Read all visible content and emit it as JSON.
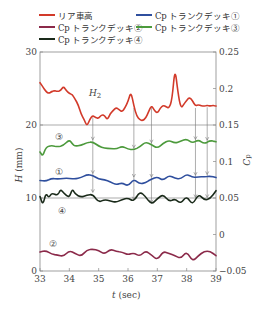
{
  "legend": {
    "items": [
      {
        "label": "リア車高",
        "color": "#d23a2a",
        "x": 39,
        "y": 14
      },
      {
        "label": "Cp トランクデッキ①",
        "color": "#2f4f9e",
        "x": 136,
        "y": 14
      },
      {
        "label": "Cp トランクデッキ②",
        "color": "#8b2a4a",
        "x": 39,
        "y": 25
      },
      {
        "label": "Cp トランクデッキ③",
        "color": "#4c9a3c",
        "x": 136,
        "y": 25
      },
      {
        "label": "Cp トランクデッキ④",
        "color": "#1a2a1a",
        "x": 39,
        "y": 36
      }
    ]
  },
  "chart_data": {
    "type": "line",
    "title": "",
    "xlabel": "t (sec)",
    "ylabel": "H (mm)",
    "y2label": "Cp",
    "xlim": [
      33,
      39
    ],
    "ylim": [
      0,
      30
    ],
    "y2lim": [
      -0.05,
      0.25
    ],
    "xticks": [
      "33",
      "34",
      "35",
      "36",
      "37",
      "38",
      "39"
    ],
    "yticks": [
      "0",
      "10",
      "20",
      "30"
    ],
    "y2ticks": [
      "-0.05",
      "0",
      "0.05",
      "0.1",
      "0.15",
      "0.2",
      "0.25"
    ],
    "grid": "horizontal lines at H=10 and H=20",
    "annotations": [
      "H2",
      "①",
      "②",
      "③",
      "④"
    ],
    "arrow_times": [
      34.8,
      36.2,
      36.8,
      38.3,
      38.7
    ],
    "series": [
      {
        "name": "リア車高",
        "axis": "left",
        "color": "#d23a2a",
        "x": [
          33.0,
          33.1,
          33.2,
          33.3,
          33.4,
          33.5,
          33.6,
          33.7,
          33.8,
          33.9,
          34.0,
          34.1,
          34.2,
          34.3,
          34.4,
          34.5,
          34.6,
          34.7,
          34.8,
          34.9,
          35.0,
          35.1,
          35.2,
          35.3,
          35.4,
          35.5,
          35.6,
          35.7,
          35.8,
          35.9,
          36.0,
          36.1,
          36.2,
          36.3,
          36.4,
          36.5,
          36.6,
          36.7,
          36.8,
          36.9,
          37.0,
          37.1,
          37.2,
          37.3,
          37.4,
          37.5,
          37.6,
          37.7,
          37.8,
          37.9,
          38.0,
          38.1,
          38.2,
          38.3,
          38.4,
          38.5,
          38.6,
          38.7,
          38.8,
          38.9,
          39.0
        ],
        "values": [
          25.8,
          25.2,
          24.6,
          24.3,
          24.6,
          24.7,
          24.6,
          24.7,
          25.3,
          24.7,
          24.3,
          24.2,
          23.5,
          22.8,
          21.5,
          20.8,
          19.8,
          20.8,
          21.3,
          21.0,
          20.9,
          21.4,
          21.3,
          20.7,
          21.6,
          22.0,
          22.4,
          22.1,
          21.8,
          22.4,
          23.2,
          24.6,
          22.6,
          21.2,
          20.7,
          20.6,
          20.9,
          21.8,
          22.7,
          22.0,
          21.6,
          22.3,
          22.7,
          22.5,
          22.3,
          23.4,
          27.9,
          24.5,
          22.3,
          22.8,
          23.4,
          23.8,
          23.3,
          22.6,
          22.8,
          22.6,
          22.6,
          22.7,
          22.6,
          22.7,
          22.6
        ]
      },
      {
        "name": "Cp トランクデッキ①",
        "axis": "right",
        "color": "#2f4f9e",
        "x": [
          33.0,
          33.2,
          33.4,
          33.6,
          33.8,
          34.0,
          34.2,
          34.4,
          34.6,
          34.8,
          35.0,
          35.2,
          35.4,
          35.6,
          35.8,
          36.0,
          36.2,
          36.4,
          36.6,
          36.8,
          37.0,
          37.2,
          37.4,
          37.6,
          37.8,
          38.0,
          38.2,
          38.4,
          38.6,
          38.8,
          39.0
        ],
        "values": [
          0.074,
          0.073,
          0.077,
          0.076,
          0.077,
          0.077,
          0.076,
          0.078,
          0.082,
          0.081,
          0.076,
          0.075,
          0.072,
          0.068,
          0.071,
          0.066,
          0.076,
          0.069,
          0.071,
          0.076,
          0.079,
          0.074,
          0.081,
          0.077,
          0.076,
          0.083,
          0.078,
          0.079,
          0.079,
          0.08,
          0.078
        ]
      },
      {
        "name": "Cp トランクデッキ②",
        "axis": "right",
        "color": "#8b2a4a",
        "x": [
          33.0,
          33.2,
          33.4,
          33.6,
          33.8,
          34.0,
          34.2,
          34.4,
          34.6,
          34.8,
          35.0,
          35.2,
          35.4,
          35.6,
          35.8,
          36.0,
          36.2,
          36.4,
          36.6,
          36.8,
          37.0,
          37.2,
          37.4,
          37.6,
          37.8,
          38.0,
          38.2,
          38.4,
          38.6,
          38.8,
          39.0
        ],
        "values": [
          -0.024,
          -0.022,
          -0.027,
          -0.028,
          -0.03,
          -0.022,
          -0.026,
          -0.03,
          -0.021,
          -0.02,
          -0.022,
          -0.027,
          -0.02,
          -0.023,
          -0.024,
          -0.028,
          -0.025,
          -0.03,
          -0.022,
          -0.028,
          -0.035,
          -0.023,
          -0.026,
          -0.029,
          -0.033,
          -0.023,
          -0.037,
          -0.029,
          -0.023,
          -0.023,
          -0.029
        ]
      },
      {
        "name": "Cp トランクデッキ③",
        "axis": "right",
        "color": "#4c9a3c",
        "x": [
          33.0,
          33.1,
          33.2,
          33.4,
          33.6,
          33.8,
          34.0,
          34.1,
          34.2,
          34.4,
          34.6,
          34.8,
          35.0,
          35.2,
          35.4,
          35.6,
          35.8,
          36.0,
          36.2,
          36.4,
          36.6,
          36.8,
          37.0,
          37.2,
          37.4,
          37.6,
          37.8,
          38.0,
          38.2,
          38.4,
          38.6,
          38.8,
          39.0
        ],
        "values": [
          0.113,
          0.107,
          0.12,
          0.122,
          0.12,
          0.122,
          0.13,
          0.124,
          0.121,
          0.122,
          0.126,
          0.127,
          0.121,
          0.118,
          0.118,
          0.117,
          0.121,
          0.117,
          0.116,
          0.12,
          0.127,
          0.123,
          0.118,
          0.125,
          0.129,
          0.125,
          0.128,
          0.131,
          0.125,
          0.13,
          0.124,
          0.129,
          0.127
        ]
      },
      {
        "name": "Cp トランクデッキ④",
        "axis": "right",
        "color": "#1a2a1a",
        "x": [
          33.0,
          33.1,
          33.2,
          33.3,
          33.4,
          33.6,
          33.7,
          33.8,
          34.0,
          34.1,
          34.2,
          34.4,
          34.6,
          34.8,
          35.0,
          35.2,
          35.4,
          35.6,
          35.8,
          36.0,
          36.2,
          36.4,
          36.6,
          36.8,
          37.0,
          37.2,
          37.4,
          37.6,
          37.8,
          38.0,
          38.2,
          38.4,
          38.6,
          38.8,
          39.0
        ],
        "values": [
          0.052,
          0.04,
          0.057,
          0.05,
          0.057,
          0.053,
          0.062,
          0.057,
          0.05,
          0.063,
          0.055,
          0.051,
          0.054,
          0.055,
          0.044,
          0.048,
          0.046,
          0.044,
          0.048,
          0.05,
          0.045,
          0.059,
          0.052,
          0.041,
          0.049,
          0.055,
          0.045,
          0.049,
          0.042,
          0.053,
          0.04,
          0.056,
          0.047,
          0.049,
          0.06
        ]
      }
    ]
  },
  "labels": {
    "h2": "H",
    "h2_sub": "2",
    "circled_1": "①",
    "circled_2": "②",
    "circled_3": "③",
    "circled_4": "④",
    "xlabel_t": "t",
    "xlabel_unit": " (sec)",
    "ylabel_h": "H",
    "ylabel_unit": " (mm)",
    "y2label_c": "C",
    "y2label_sub": "p"
  }
}
